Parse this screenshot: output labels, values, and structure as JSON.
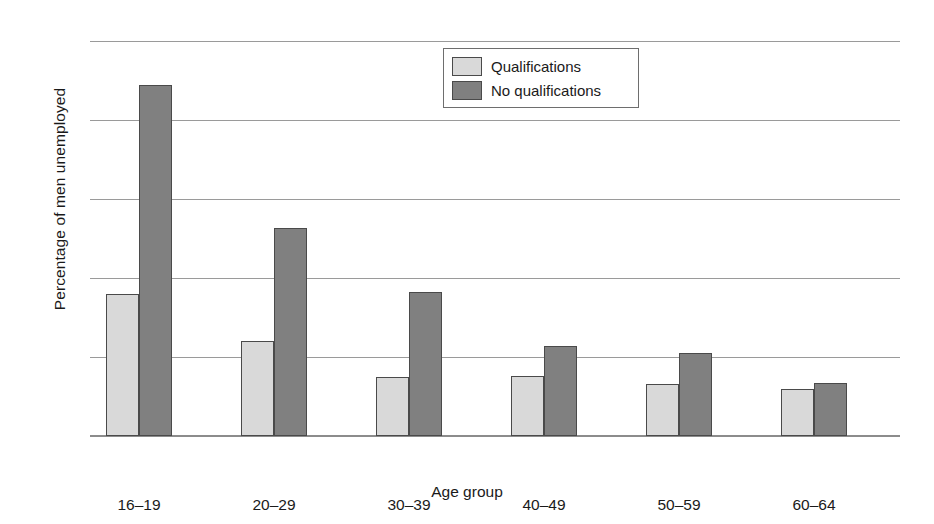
{
  "chart_data": {
    "type": "bar",
    "title": "",
    "xlabel": "Age group",
    "ylabel": "Percentage of men unemployed",
    "categories": [
      "16–19",
      "20–29",
      "30–39",
      "40–49",
      "50–59",
      "60–64"
    ],
    "series": [
      {
        "name": "Qualifications",
        "color": "#d9d9d9",
        "values": [
          18.0,
          12.0,
          7.5,
          7.6,
          6.6,
          6.0
        ]
      },
      {
        "name": "No qualifications",
        "color": "#808080",
        "values": [
          44.4,
          26.3,
          18.2,
          11.4,
          10.5,
          6.7
        ]
      }
    ],
    "ylim": [
      0,
      50
    ],
    "yticks": [
      0,
      10,
      20,
      30,
      40,
      50
    ],
    "ytick_labels": [
      "0",
      "10",
      "20",
      "30",
      "40",
      "50"
    ],
    "grid": true,
    "grid_axis": "y",
    "legend_position": "upper center"
  },
  "legend": {
    "entries": [
      {
        "label": "Qualifications",
        "swatch": "light"
      },
      {
        "label": "No qualifications",
        "swatch": "dark"
      }
    ]
  },
  "axes": {
    "y_title": "Percentage of men unemployed",
    "x_title": "Age group"
  }
}
